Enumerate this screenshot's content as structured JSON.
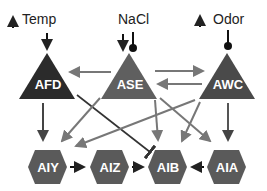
{
  "stimuli": {
    "temp": {
      "label": "Temp",
      "arrow": "up"
    },
    "nacl": {
      "label": "NaCl"
    },
    "odor": {
      "label": "Odor",
      "arrow": "up"
    }
  },
  "sensory_neurons": [
    {
      "id": "AFD",
      "label": "AFD",
      "color": "#2b2b2b"
    },
    {
      "id": "ASE",
      "label": "ASE",
      "color": "#5f5f5f"
    },
    {
      "id": "AWC",
      "label": "AWC",
      "color": "#4a4a4a"
    }
  ],
  "interneurons": [
    {
      "id": "AIY",
      "label": "AIY"
    },
    {
      "id": "AIZ",
      "label": "AIZ"
    },
    {
      "id": "AIB",
      "label": "AIB"
    },
    {
      "id": "AIA",
      "label": "AIA"
    }
  ],
  "colors": {
    "hexagon": "#5a5a5a",
    "arrow_gray": "#777777",
    "arrow_dark": "#333333"
  },
  "edges": [
    {
      "from": "Temp",
      "to": "AFD",
      "type": "excitatory"
    },
    {
      "from": "NaCl",
      "to": "ASE",
      "type": "excitatory"
    },
    {
      "from": "NaCl",
      "to": "ASE",
      "type": "inhibitory"
    },
    {
      "from": "Odor",
      "to": "AWC",
      "type": "inhibitory"
    },
    {
      "from": "ASE",
      "to": "AFD",
      "type": "excitatory"
    },
    {
      "from": "ASE",
      "to": "AWC",
      "type": "excitatory"
    },
    {
      "from": "AWC",
      "to": "ASE",
      "type": "excitatory"
    },
    {
      "from": "AFD",
      "to": "AIY",
      "type": "excitatory"
    },
    {
      "from": "AFD",
      "to": "AIB",
      "type": "inhibitory"
    },
    {
      "from": "ASE",
      "to": "AIY",
      "type": "excitatory"
    },
    {
      "from": "ASE",
      "to": "AIB",
      "type": "excitatory"
    },
    {
      "from": "ASE",
      "to": "AIA",
      "type": "excitatory"
    },
    {
      "from": "AWC",
      "to": "AIY",
      "type": "excitatory"
    },
    {
      "from": "AWC",
      "to": "AIB",
      "type": "excitatory"
    },
    {
      "from": "AWC",
      "to": "AIA",
      "type": "excitatory"
    },
    {
      "from": "AIY",
      "to": "AIZ",
      "type": "excitatory"
    },
    {
      "from": "AIZ",
      "to": "AIB",
      "type": "excitatory"
    },
    {
      "from": "AIA",
      "to": "AIB",
      "type": "excitatory"
    }
  ]
}
